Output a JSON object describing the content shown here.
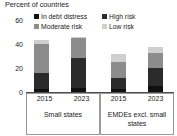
{
  "chart_data": {
    "type": "bar",
    "subtype": "stacked",
    "title": "Percent of countries",
    "xlabel": "",
    "ylabel": "",
    "ylim": [
      0,
      65
    ],
    "yticks": [
      0,
      20,
      40,
      60
    ],
    "grid": false,
    "legend_position": "top",
    "categories": [
      "2015",
      "2023",
      "2015",
      "2023"
    ],
    "groups": [
      {
        "label": "Small states",
        "categories": [
          "2015",
          "2023"
        ]
      },
      {
        "label": "EMDEs excl. small states",
        "categories": [
          "2015",
          "2023"
        ]
      }
    ],
    "series": [
      {
        "name": "In debt distress",
        "color": "#101010",
        "values": [
          3,
          4,
          3,
          5
        ]
      },
      {
        "name": "High risk",
        "color": "#2b2b2b",
        "values": [
          14,
          27,
          10,
          17
        ]
      },
      {
        "name": "Moderate risk",
        "color": "#8c8c8c",
        "values": [
          26,
          18,
          14,
          13
        ]
      },
      {
        "name": "Low risk",
        "color": "#cfcfcf",
        "values": [
          4,
          1,
          7,
          6
        ]
      }
    ],
    "totals": [
      47,
      50,
      34,
      41
    ]
  },
  "title": "Percent of countries",
  "legend": {
    "items": [
      {
        "label": "In debt distress",
        "color": "#101010"
      },
      {
        "label": "High risk",
        "color": "#2b2b2b"
      },
      {
        "label": "Moderate risk",
        "color": "#8c8c8c"
      },
      {
        "label": "Low risk",
        "color": "#cfcfcf"
      }
    ]
  },
  "yaxis": {
    "ticks": [
      "60",
      "40",
      "20",
      "0"
    ]
  },
  "xaxis": {
    "tick_labels": [
      "2015",
      "2023",
      "2015",
      "2023"
    ],
    "group_labels": [
      "Small states",
      "EMDEs excl. small states"
    ],
    "group_label_2_line1": "EMDEs excl. small",
    "group_label_2_line2": "states"
  }
}
